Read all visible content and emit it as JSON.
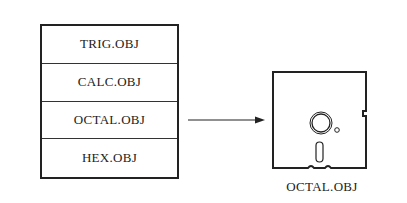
{
  "stack": {
    "items": [
      {
        "label": "TRIG.OBJ"
      },
      {
        "label": "CALC.OBJ"
      },
      {
        "label": "OCTAL.OBJ"
      },
      {
        "label": "HEX.OBJ"
      }
    ]
  },
  "arrow": {
    "from": "OCTAL.OBJ",
    "to": "floppy-disk"
  },
  "disk": {
    "label": "OCTAL.OBJ",
    "icon": "floppy-disk-icon"
  }
}
